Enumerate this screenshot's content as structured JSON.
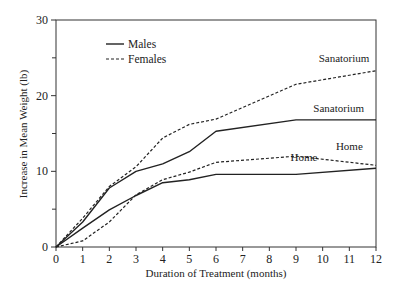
{
  "chart_data": {
    "type": "line",
    "title": "",
    "xlabel": "Duration of Treatment (months)",
    "ylabel": "Increase in Mean Weight (lb)",
    "xlim": [
      0,
      12
    ],
    "ylim": [
      0,
      30
    ],
    "x_ticks": [
      0,
      1,
      2,
      3,
      4,
      5,
      6,
      7,
      8,
      9,
      10,
      11,
      12
    ],
    "y_ticks": [
      0,
      10,
      20,
      30
    ],
    "y_minor_ticks": [
      5,
      15,
      25
    ],
    "grid": false,
    "legend": {
      "position": "upper-left",
      "entries": [
        {
          "label": "Males",
          "style": "solid"
        },
        {
          "label": "Females",
          "style": "dashed"
        }
      ]
    },
    "series": [
      {
        "name": "Males - Sanatorium",
        "style": "solid",
        "x": [
          0,
          1,
          2,
          3,
          4,
          5,
          6,
          9,
          12
        ],
        "values": [
          0,
          3.3,
          7.8,
          10.0,
          11.0,
          12.6,
          15.3,
          16.8,
          16.8
        ]
      },
      {
        "name": "Females - Sanatorium",
        "style": "dashed",
        "x": [
          0,
          1,
          2,
          3,
          4,
          5,
          6,
          9,
          12
        ],
        "values": [
          0,
          3.8,
          8.0,
          10.6,
          14.4,
          16.2,
          16.9,
          21.5,
          23.3
        ]
      },
      {
        "name": "Males - Home",
        "style": "solid",
        "x": [
          0,
          1,
          2,
          3,
          4,
          5,
          6,
          9,
          12
        ],
        "values": [
          0,
          2.5,
          4.9,
          6.8,
          8.5,
          8.9,
          9.6,
          9.6,
          10.4
        ]
      },
      {
        "name": "Females - Home",
        "style": "dashed",
        "x": [
          0,
          1,
          2,
          3,
          4,
          5,
          6,
          9,
          12
        ],
        "values": [
          0,
          0.8,
          3.3,
          6.9,
          8.9,
          9.9,
          11.2,
          12.0,
          10.8
        ]
      }
    ],
    "annotations": [
      {
        "text": "Sanatorium",
        "near": "Females - Sanatorium",
        "x": 10.8,
        "y": 24.5
      },
      {
        "text": "Sanatorium",
        "near": "Males - Sanatorium",
        "x": 10.6,
        "y": 17.8
      },
      {
        "text": "Home",
        "near": "Females - Home",
        "x": 11.0,
        "y": 12.8
      },
      {
        "text": "Home",
        "near": "Males - Home",
        "x": 9.3,
        "y": 11.3
      }
    ]
  }
}
